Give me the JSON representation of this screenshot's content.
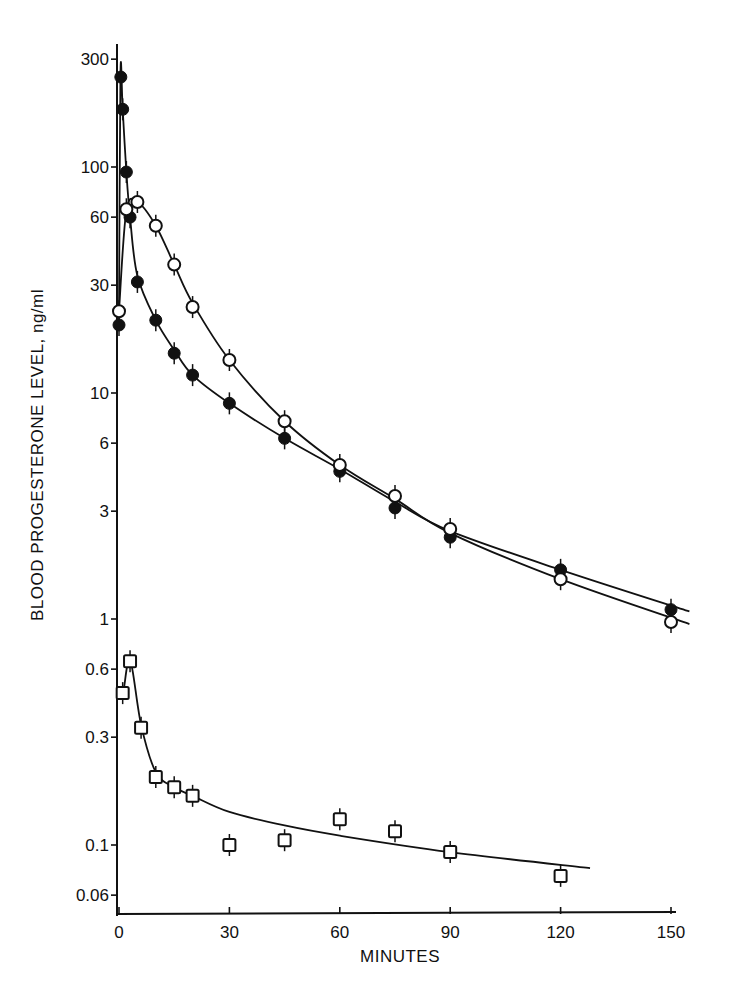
{
  "chart_data": {
    "type": "scatter",
    "title": "",
    "xlabel": "MINUTES",
    "ylabel": "BLOOD PROGESTERONE LEVEL, ng/ml",
    "xlim": [
      0,
      155
    ],
    "ylim": [
      0.05,
      400
    ],
    "yscale": "log",
    "grid": false,
    "legend": null,
    "x_ticks": [
      0,
      30,
      60,
      90,
      120,
      150
    ],
    "x_tick_labels": [
      "0",
      "30",
      "60",
      "90",
      "120",
      "150"
    ],
    "y_ticks": [
      300,
      100,
      60,
      30,
      10,
      6,
      3,
      1,
      0.6,
      0.3,
      0.1,
      0.06
    ],
    "y_tick_labels": [
      "300",
      "100",
      "60",
      "30",
      "10",
      "6",
      "3",
      "1",
      "0.6",
      "0.3",
      "0.1",
      "0.06"
    ],
    "series": [
      {
        "name": "filled circles",
        "marker": "filled-circle",
        "x": [
          0,
          0.5,
          1,
          2,
          3,
          5,
          10,
          15,
          20,
          30,
          45,
          60,
          75,
          90,
          120,
          150
        ],
        "values": [
          20,
          250,
          180,
          95,
          60,
          31,
          21,
          15,
          12,
          9,
          6.3,
          4.5,
          3.1,
          2.3,
          1.65,
          1.1
        ]
      },
      {
        "name": "open circles",
        "marker": "open-circle",
        "x": [
          0,
          2,
          5,
          10,
          15,
          20,
          30,
          45,
          60,
          75,
          90,
          120,
          150
        ],
        "values": [
          23,
          65,
          70,
          55,
          37,
          24,
          14,
          7.5,
          4.8,
          3.5,
          2.5,
          1.5,
          0.97
        ]
      },
      {
        "name": "open squares",
        "marker": "open-square",
        "x": [
          1,
          3,
          6,
          10,
          15,
          20,
          30,
          45,
          60,
          75,
          90,
          120
        ],
        "values": [
          0.47,
          0.65,
          0.33,
          0.2,
          0.18,
          0.165,
          0.1,
          0.105,
          0.13,
          0.115,
          0.093,
          0.073
        ]
      }
    ]
  }
}
